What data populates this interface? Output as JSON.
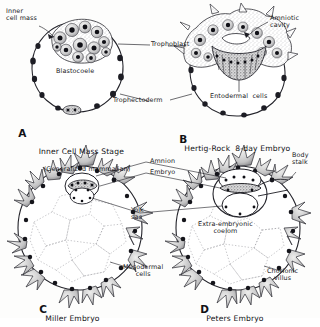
{
  "figure": {
    "style": "grayscale stipple line drawing",
    "ink_color": "#17171a",
    "paper_color": "#fdfdfc",
    "panel_count": 4
  },
  "panels": [
    {
      "id": "A",
      "letter": "A",
      "caption_line1": "Inner Cell Mass Stage",
      "caption_line2": "(Generalized mammalian)",
      "labels": [
        {
          "key": "inner_cell_mass",
          "text": "Inner\ncell mass"
        },
        {
          "key": "blastocoele",
          "text": "Blastocoele"
        },
        {
          "key": "trophoblast",
          "text": "Trophoblast"
        },
        {
          "key": "trophectoderm",
          "text": "Trophectoderm"
        }
      ]
    },
    {
      "id": "B",
      "letter": "B",
      "caption_line1": "Hertig-Rock  8-day Embryo",
      "caption_line2": "",
      "labels": [
        {
          "key": "amniotic_cavity",
          "text": "Amniotic\ncavity"
        },
        {
          "key": "entodermal_cells",
          "text": "Entodermal  cells"
        }
      ]
    },
    {
      "id": "C",
      "letter": "C",
      "caption_line1": "Miller Embryo",
      "caption_line2": "",
      "labels": [
        {
          "key": "amnion",
          "text": "Amnion"
        },
        {
          "key": "embryo",
          "text": "Embryo"
        },
        {
          "key": "yolk_sac",
          "text": "Yolk\nsac"
        },
        {
          "key": "mesodermal_cells",
          "text": "Mesodermal\ncells"
        }
      ]
    },
    {
      "id": "D",
      "letter": "D",
      "caption_line1": "Peters Embryo",
      "caption_line2": "",
      "labels": [
        {
          "key": "body_stalk",
          "text": "Body\nstalk"
        },
        {
          "key": "extra_embryonic_coelom",
          "text": "Extra-embryonic\ncoelom"
        },
        {
          "key": "chorionic_villus",
          "text": "Chorionic\nvillus"
        }
      ]
    }
  ],
  "label_text": {
    "inner_cell_mass_l1": "Inner",
    "inner_cell_mass_l2": "cell mass",
    "blastocoele": "Blastocoele",
    "trophoblast": "Trophoblast",
    "trophectoderm": "Trophectoderm",
    "amniotic_cavity_l1": "Amniotic",
    "amniotic_cavity_l2": "cavity",
    "entodermal_cells": "Entodermal  cells",
    "amnion": "Amnion",
    "embryo": "Embryo",
    "yolk_sac_l1": "Yolk",
    "yolk_sac_l2": "sac",
    "mesodermal_cells_l1": "Mesodermal",
    "mesodermal_cells_l2": "cells",
    "body_stalk_l1": "Body",
    "body_stalk_l2": "stalk",
    "extra_embryonic_coelom_l1": "Extra-embryonic",
    "extra_embryonic_coelom_l2": "coelom",
    "chorionic_villus_l1": "Chorionic",
    "chorionic_villus_l2": "villus"
  },
  "captions": {
    "a_letter": "A",
    "a_line1": "Inner Cell Mass Stage",
    "a_line2": "(Generalized mammalian)",
    "b_letter": "B",
    "b_line1": "Hertig-Rock  8-day Embryo",
    "c_letter": "C",
    "c_line1": "Miller Embryo",
    "d_letter": "D",
    "d_line1": "Peters Embryo"
  }
}
